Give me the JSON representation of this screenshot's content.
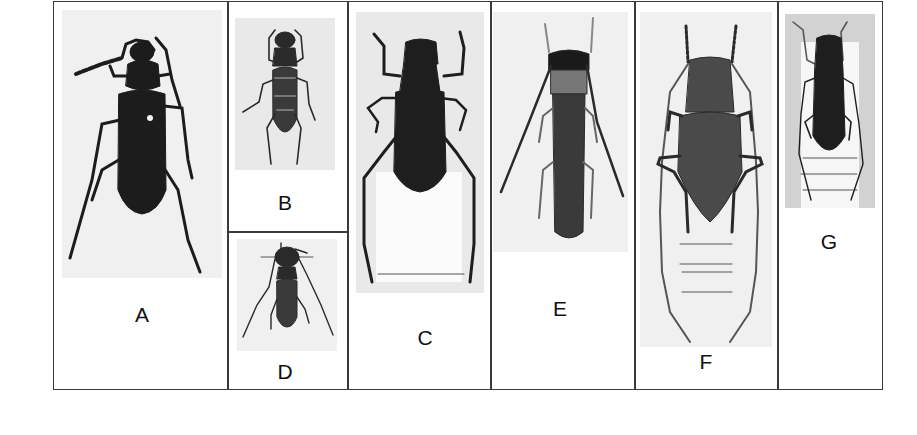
{
  "figure": {
    "panels": [
      {
        "id": "A",
        "label": "A",
        "description": "large dark longhorn beetle, dorsal view"
      },
      {
        "id": "B",
        "label": "B",
        "description": "small mottled longhorn beetle, dorsal view"
      },
      {
        "id": "C",
        "label": "C",
        "description": "dark longhorn beetle with long legs, on pinned label"
      },
      {
        "id": "D",
        "label": "D",
        "description": "small longhorn beetle with long antennae"
      },
      {
        "id": "E",
        "label": "E",
        "description": "slender elongate longhorn beetle"
      },
      {
        "id": "F",
        "label": "F",
        "description": "large long-antennae longhorn beetle with specimen labels"
      },
      {
        "id": "G",
        "label": "G",
        "description": "small dark longhorn beetle with specimen labels"
      }
    ],
    "colors": {
      "border": "#3a3a3a",
      "photo_background": "#e9e9e9",
      "specimen_dark": "#1e1e1e",
      "label_text": "#111111"
    }
  }
}
